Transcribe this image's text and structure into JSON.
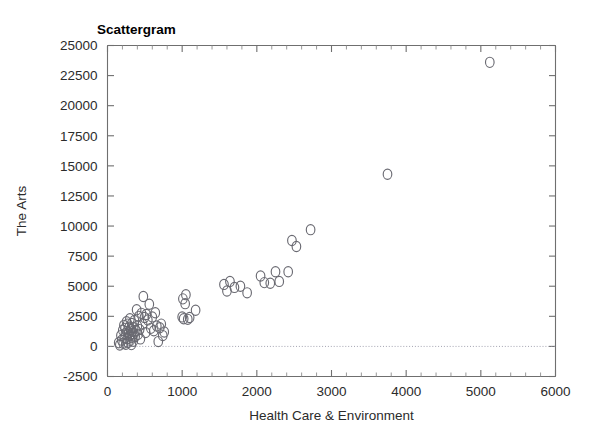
{
  "chart": {
    "title": "Scattergram",
    "xlabel": "Health Care & Environment",
    "ylabel": "The Arts"
  },
  "chart_data": {
    "type": "scatter",
    "title": "Scattergram",
    "xlabel": "Health Care & Environment",
    "ylabel": "The Arts",
    "xlim": [
      0,
      6000
    ],
    "ylim": [
      -2500,
      25000
    ],
    "xticks": [
      0,
      1000,
      2000,
      3000,
      4000,
      5000,
      6000
    ],
    "xtick_labels": [
      "0",
      "1000",
      "2000",
      "3000",
      "4000",
      "5000",
      "6000"
    ],
    "yticks": [
      -2500,
      0,
      2500,
      5000,
      7500,
      10000,
      12500,
      15000,
      17500,
      20000,
      22500,
      25000
    ],
    "ytick_labels": [
      "-2500",
      "0",
      "2500",
      "5000",
      "7500",
      "10000",
      "12500",
      "15000",
      "17500",
      "20000",
      "22500",
      "25000"
    ],
    "x_minor_tick_step": 200,
    "grid": false,
    "legend": null,
    "marker": "open-circle",
    "marker_color": "#6a6a72",
    "reference_lines": [
      {
        "axis": "y",
        "value": 0,
        "style": "dotted"
      }
    ],
    "series": [
      {
        "name": "observations",
        "points": [
          [
            150,
            300
          ],
          [
            165,
            120
          ],
          [
            180,
            900
          ],
          [
            190,
            520
          ],
          [
            205,
            1350
          ],
          [
            210,
            260
          ],
          [
            220,
            1750
          ],
          [
            225,
            700
          ],
          [
            235,
            1500
          ],
          [
            240,
            1050
          ],
          [
            245,
            180
          ],
          [
            255,
            2050
          ],
          [
            260,
            1250
          ],
          [
            265,
            640
          ],
          [
            270,
            1850
          ],
          [
            275,
            330
          ],
          [
            285,
            1150
          ],
          [
            290,
            1600
          ],
          [
            295,
            900
          ],
          [
            300,
            2300
          ],
          [
            305,
            500
          ],
          [
            310,
            1400
          ],
          [
            315,
            1000
          ],
          [
            320,
            150
          ],
          [
            325,
            1900
          ],
          [
            330,
            760
          ],
          [
            335,
            1250
          ],
          [
            345,
            430
          ],
          [
            350,
            1550
          ],
          [
            355,
            1050
          ],
          [
            360,
            2150
          ],
          [
            370,
            820
          ],
          [
            380,
            1300
          ],
          [
            390,
            3050
          ],
          [
            400,
            1700
          ],
          [
            410,
            1000
          ],
          [
            420,
            2500
          ],
          [
            430,
            1400
          ],
          [
            440,
            620
          ],
          [
            455,
            2750
          ],
          [
            470,
            1850
          ],
          [
            480,
            4150
          ],
          [
            495,
            2400
          ],
          [
            510,
            1150
          ],
          [
            520,
            2650
          ],
          [
            540,
            2200
          ],
          [
            560,
            3500
          ],
          [
            580,
            1500
          ],
          [
            600,
            2450
          ],
          [
            620,
            1300
          ],
          [
            640,
            2800
          ],
          [
            660,
            1700
          ],
          [
            680,
            400
          ],
          [
            700,
            1550
          ],
          [
            720,
            1850
          ],
          [
            740,
            900
          ],
          [
            760,
            1200
          ],
          [
            1000,
            2450
          ],
          [
            1010,
            3950
          ],
          [
            1020,
            2300
          ],
          [
            1040,
            3550
          ],
          [
            1050,
            4300
          ],
          [
            1075,
            2250
          ],
          [
            1100,
            2400
          ],
          [
            1180,
            3000
          ],
          [
            1560,
            5150
          ],
          [
            1600,
            4600
          ],
          [
            1640,
            5400
          ],
          [
            1700,
            4900
          ],
          [
            1780,
            5000
          ],
          [
            1870,
            4450
          ],
          [
            2050,
            5850
          ],
          [
            2100,
            5300
          ],
          [
            2180,
            5250
          ],
          [
            2250,
            6200
          ],
          [
            2300,
            5400
          ],
          [
            2420,
            6200
          ],
          [
            2470,
            8800
          ],
          [
            2530,
            8300
          ],
          [
            2720,
            9700
          ],
          [
            3750,
            14300
          ],
          [
            5120,
            23600
          ]
        ]
      }
    ]
  }
}
